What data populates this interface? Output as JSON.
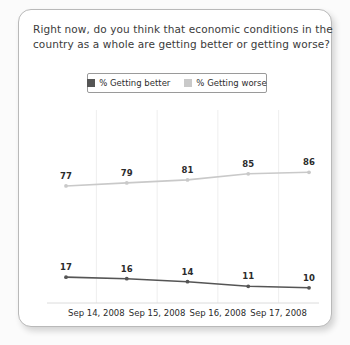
{
  "card": {
    "title_line1": "Right now, do you think that economic conditions in the",
    "title_line2": "country as a whole are getting better or getting worse?"
  },
  "legend": {
    "entries": [
      {
        "label": "% Getting better",
        "color": "#555555",
        "swatch_name": "legend-swatch-getting-better"
      },
      {
        "label": "% Getting worse",
        "color": "#c9c9c9",
        "swatch_name": "legend-swatch-getting-worse"
      }
    ]
  },
  "chart_data": {
    "type": "line",
    "title": "Right now, do you think that economic conditions in the country as a whole are getting better or getting worse?",
    "xlabel": "",
    "ylabel": "",
    "ylim": [
      0,
      100
    ],
    "grid": "vertical",
    "legend_position": "top-center",
    "x_tick_labels": [
      "Sep 14, 2008",
      "Sep 15, 2008",
      "Sep 16, 2008",
      "Sep 17, 2008"
    ],
    "series": [
      {
        "name": "% Getting worse",
        "color": "#c9c9c9",
        "values": [
          77,
          79,
          81,
          85,
          86
        ],
        "labels": [
          "77",
          "79",
          "81",
          "85",
          "86"
        ]
      },
      {
        "name": "% Getting better",
        "color": "#555555",
        "values": [
          17,
          16,
          14,
          11,
          10
        ],
        "labels": [
          "17",
          "16",
          "14",
          "11",
          "10"
        ]
      }
    ]
  }
}
